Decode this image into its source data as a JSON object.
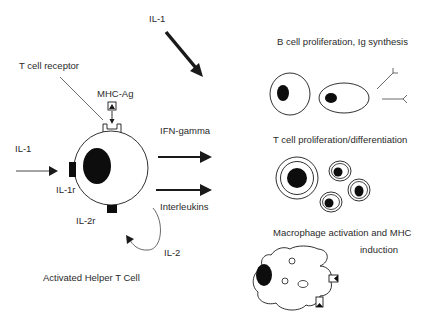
{
  "diagram": {
    "title": "Activated Helper T Cell",
    "central_cell": {
      "label": "Activated Helper T Cell",
      "receptors": {
        "tcr": "T cell receptor",
        "antigen": "MHC-Ag",
        "il1r": "IL-1r",
        "il2r": "IL-2r"
      },
      "inputs": {
        "il1_left": "IL-1",
        "il1_top": "IL-1"
      },
      "autocrine": "IL-2"
    },
    "outputs": {
      "ifn": "IFN-gamma",
      "interleukins": "Interleukins"
    },
    "effects": [
      {
        "label": "B cell proliferation, Ig synthesis"
      },
      {
        "label": "T cell proliferation/differentiation"
      },
      {
        "label_line1": "Macrophage activation and MHC",
        "label_line2": "induction"
      }
    ]
  },
  "colors": {
    "ink": "#1a1a1a",
    "text": "#2a2a2a",
    "background": "#ffffff"
  }
}
